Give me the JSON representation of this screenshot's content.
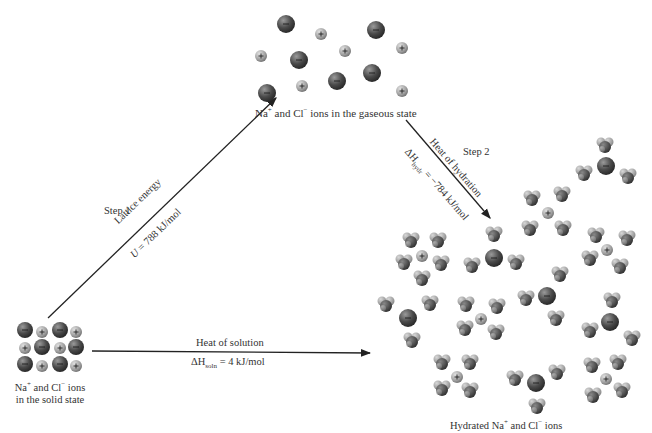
{
  "diagram": {
    "type": "thermochemical cycle"
  },
  "states": {
    "gas": {
      "label_pre": "Na",
      "sup1": "+",
      "mid": " and Cl",
      "sup2": "−",
      "post": " ions in the gaseous state"
    },
    "solid": {
      "line1_pre": "Na",
      "sup1": "+",
      "line1_mid": " and Cl",
      "sup2": "−",
      "line1_post": " ions",
      "line2": "in the solid state"
    },
    "hydrated": {
      "pre": "Hydrated Na",
      "sup1": "+",
      "mid": " and Cl",
      "sup2": "−",
      "post": " ions"
    }
  },
  "steps": {
    "step1": {
      "label": "Step 1",
      "title": "Lattice energy",
      "symbol": "U",
      "value": " = 788 kJ/mol"
    },
    "step2": {
      "label": "Step 2",
      "title": "Heat of hydration",
      "symbol": "ΔH",
      "sub": "hydr",
      "value": " = −784 kJ/mol"
    },
    "direct": {
      "title": "Heat of solution",
      "symbol": "ΔH",
      "sub": "soln",
      "value": " = 4 kJ/mol"
    }
  },
  "colors": {
    "chloride": "#4a4a4a",
    "sodium": "#a8a8a8",
    "water_o": "#5a5a5a",
    "water_h": "#b0b0b0",
    "arrow": "#222222"
  }
}
